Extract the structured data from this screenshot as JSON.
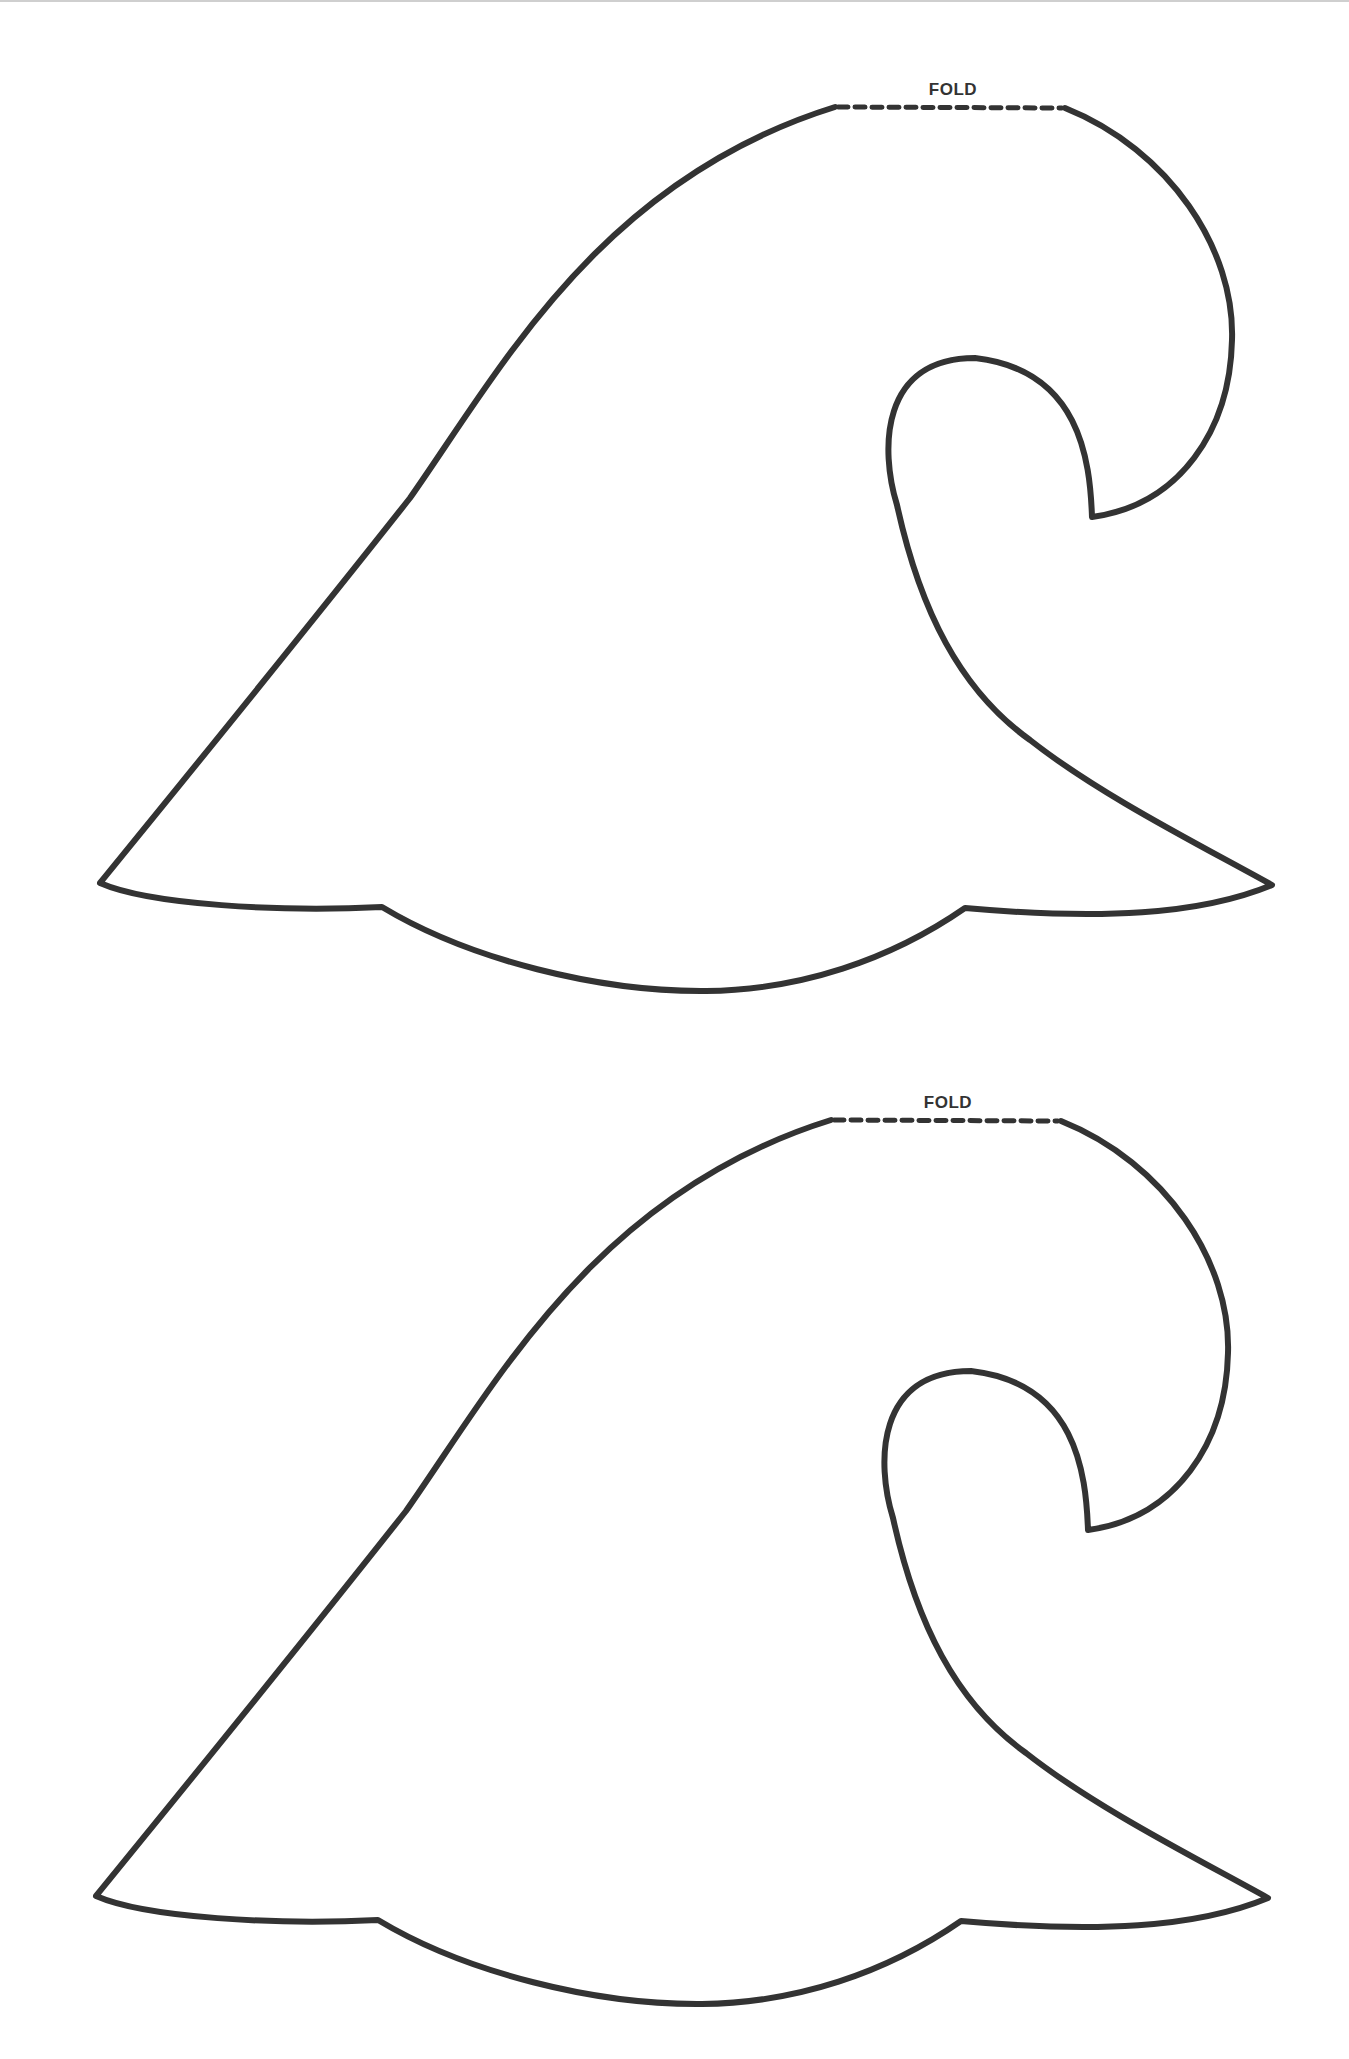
{
  "document": {
    "type": "printable template",
    "colors": {
      "outline": "#333333",
      "background": "#ffffff"
    },
    "templates": [
      {
        "name": "wave-template-1",
        "fold_label": "FOLD"
      },
      {
        "name": "wave-template-2",
        "fold_label": "FOLD"
      }
    ]
  }
}
